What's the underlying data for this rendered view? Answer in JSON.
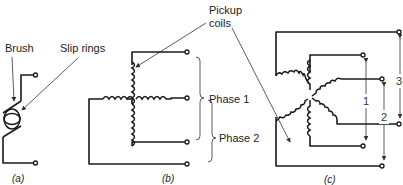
{
  "figure": {
    "panel_a": {
      "caption": "(a)",
      "labels": {
        "brush": "Brush",
        "slip_rings": "Slip rings"
      }
    },
    "panel_b": {
      "caption": "(b)",
      "labels": {
        "pickup_coils": [
          "Pickup",
          "coils"
        ],
        "phase1": "Phase 1",
        "phase2": "Phase 2"
      }
    },
    "panel_c": {
      "caption": "(c)",
      "labels": {
        "dim1": "1",
        "dim2": "2",
        "dim3": "3"
      }
    }
  }
}
